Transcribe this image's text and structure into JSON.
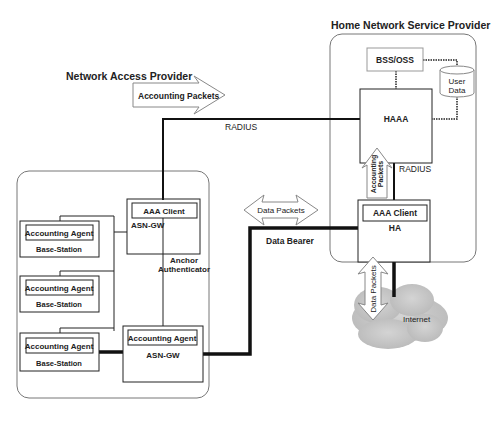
{
  "regions": {
    "home": {
      "title": "Home Network Service Provider"
    },
    "access": {
      "title": "Network Access Provider"
    }
  },
  "nodes": {
    "bss_oss": "BSS/OSS",
    "user_data": [
      "User",
      "Data"
    ],
    "haaa": "HAAA",
    "ha_client": "AAA Client",
    "ha": "HA",
    "asn_top_client": "AAA Client",
    "asn_top": "ASN-GW",
    "anchor": [
      "Anchor",
      "Authenticator"
    ],
    "asn_bottom_agent": "Accounting Agent",
    "asn_bottom": "ASN-GW",
    "base_stations": [
      {
        "agent": "Accounting Agent",
        "label": "Base-Station"
      },
      {
        "agent": "Accounting Agent",
        "label": "Base-Station"
      },
      {
        "agent": "Accounting Agent",
        "label": "Base-Station"
      }
    ],
    "internet": "Internet"
  },
  "links": {
    "radius_top": "RADIUS",
    "radius_right": "RADIUS",
    "data_bearer": "Data Bearer"
  },
  "arrows": {
    "accounting_top": "Accounting Packets",
    "accounting_vertical": [
      "Accounting",
      "Packets"
    ],
    "data_horizontal": "Data Packets",
    "data_vertical": "Data Packets"
  }
}
